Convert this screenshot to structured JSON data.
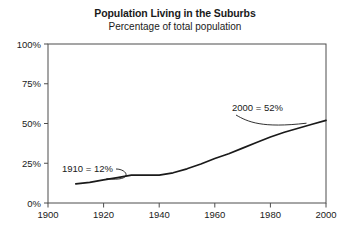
{
  "chart_data": {
    "type": "line",
    "title": "Population Living in the Suburbs",
    "subtitle": "Percentage of total population",
    "xlabel": "",
    "ylabel": "",
    "xlim": [
      1900,
      2000
    ],
    "ylim": [
      0,
      100
    ],
    "grid": false,
    "legend": "none",
    "xticks": [
      1900,
      1920,
      1940,
      1960,
      1980,
      2000
    ],
    "xtick_labels": [
      "1900",
      "1920",
      "1940",
      "1960",
      "1980",
      "2000"
    ],
    "yticks": [
      0,
      25,
      50,
      75,
      100
    ],
    "ytick_labels": [
      "0%",
      "25%",
      "50%",
      "75%",
      "100%"
    ],
    "line_color": "#1a1a1a",
    "x": [
      1910,
      1915,
      1920,
      1925,
      1930,
      1935,
      1940,
      1945,
      1950,
      1955,
      1960,
      1965,
      1970,
      1975,
      1980,
      1985,
      1990,
      1995,
      2000
    ],
    "values": [
      12,
      13,
      14.5,
      16,
      17.5,
      17.5,
      17.5,
      19,
      21.5,
      24.5,
      28,
      31,
      34.5,
      38,
      41.5,
      44.5,
      47,
      49.5,
      52
    ],
    "series": [
      {
        "name": "Population living in the suburbs",
        "values": [
          12,
          13,
          14.5,
          16,
          17.5,
          17.5,
          17.5,
          19,
          21.5,
          24.5,
          28,
          31,
          34.5,
          38,
          41.5,
          44.5,
          47,
          49.5,
          52
        ]
      }
    ],
    "annotations": [
      {
        "text": "1910 = 12%",
        "x": 1910,
        "y": 12
      },
      {
        "text": "2000 = 52%",
        "x": 2000,
        "y": 52
      }
    ]
  }
}
